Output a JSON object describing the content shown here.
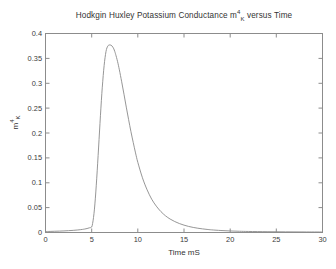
{
  "figure": {
    "background_color": "#ffffff",
    "axes_color": "#808080",
    "text_color": "#333333",
    "curve_color": "#8a8a8a"
  },
  "title": {
    "prefix": "Hodkgin Huxley Potassium Conductance m",
    "sup": "4",
    "sub": "K",
    "suffix": " versus Time",
    "full": "Hodkgin Huxley Potassium Conductance m4K versus Time"
  },
  "axes": {
    "xlabel": "Time mS",
    "ylabel_base": "m",
    "ylabel_sup": "4",
    "ylabel_sub": "K",
    "ylabel_full": "m4K",
    "xticks": [
      "0",
      "5",
      "10",
      "15",
      "20",
      "25",
      "30"
    ],
    "yticks": [
      "0",
      "0.05",
      "0.1",
      "0.15",
      "0.2",
      "0.25",
      "0.3",
      "0.35",
      "0.4"
    ]
  },
  "chart_data": {
    "type": "line",
    "xlabel": "Time mS",
    "ylabel": "m^4_K",
    "xlim": [
      0,
      30
    ],
    "ylim": [
      0,
      0.4
    ],
    "grid": false,
    "legend": "none",
    "xticks": [
      0,
      5,
      10,
      15,
      20,
      25,
      30
    ],
    "yticks": [
      0,
      0.05,
      0.1,
      0.15,
      0.2,
      0.25,
      0.3,
      0.35,
      0.4
    ],
    "series": [
      {
        "name": "m^4_K",
        "color": "#8a8a8a",
        "x": [
          0,
          0.5,
          1,
          1.5,
          2,
          2.5,
          3,
          3.5,
          4,
          4.25,
          4.5,
          4.75,
          5,
          5.1,
          5.2,
          5.3,
          5.4,
          5.5,
          5.6,
          5.7,
          5.8,
          5.9,
          6,
          6.1,
          6.2,
          6.3,
          6.4,
          6.5,
          6.6,
          6.7,
          6.8,
          6.9,
          7,
          7.1,
          7.2,
          7.3,
          7.4,
          7.5,
          7.6,
          7.8,
          8,
          8.25,
          8.5,
          8.75,
          9,
          9.25,
          9.5,
          9.75,
          10,
          10.5,
          11,
          11.5,
          12,
          12.5,
          13,
          13.5,
          14,
          14.5,
          15,
          15.5,
          16,
          16.5,
          17,
          17.5,
          18,
          19,
          20,
          21,
          22,
          24,
          26,
          28,
          30
        ],
        "y": [
          0.002,
          0.0022,
          0.0025,
          0.0028,
          0.0032,
          0.0037,
          0.0043,
          0.0051,
          0.0062,
          0.007,
          0.008,
          0.0094,
          0.011,
          0.018,
          0.03,
          0.047,
          0.069,
          0.095,
          0.124,
          0.155,
          0.187,
          0.219,
          0.25,
          0.279,
          0.304,
          0.326,
          0.344,
          0.358,
          0.368,
          0.373,
          0.376,
          0.377,
          0.377,
          0.3765,
          0.375,
          0.3725,
          0.369,
          0.364,
          0.358,
          0.344,
          0.327,
          0.303,
          0.278,
          0.252,
          0.227,
          0.203,
          0.181,
          0.16,
          0.141,
          0.11,
          0.086,
          0.067,
          0.053,
          0.042,
          0.0335,
          0.027,
          0.022,
          0.018,
          0.0148,
          0.0122,
          0.0102,
          0.0086,
          0.0073,
          0.0062,
          0.0053,
          0.004,
          0.0031,
          0.0025,
          0.0021,
          0.0016,
          0.0013,
          0.0011,
          0.001
        ],
        "peak": {
          "x": 7.05,
          "y": 0.377
        }
      }
    ]
  }
}
